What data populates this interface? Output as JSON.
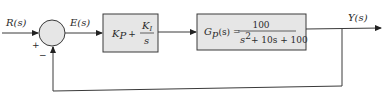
{
  "diagram": {
    "type": "feedback-control-block-diagram",
    "signals": {
      "input": "R(s)",
      "error": "E(s)",
      "output": "Y(s)"
    },
    "summing_junction": {
      "plus_sign": "+",
      "minus_sign": "−"
    },
    "controller_block": {
      "kp": "K",
      "kp_sub": "P",
      "plus": "+",
      "ki": "K",
      "ki_sub": "I",
      "ki_den": "s"
    },
    "plant_block": {
      "g": "G",
      "g_sub": "p",
      "arg": "(s) =",
      "numerator": "100",
      "den_s": "s",
      "den_exp": "2",
      "den_rest": "+ 10s + 100"
    },
    "colors": {
      "line": "#3a3a3a",
      "block_fill": "#e6e6e6",
      "junction_fill": "#e6e6e6"
    }
  }
}
